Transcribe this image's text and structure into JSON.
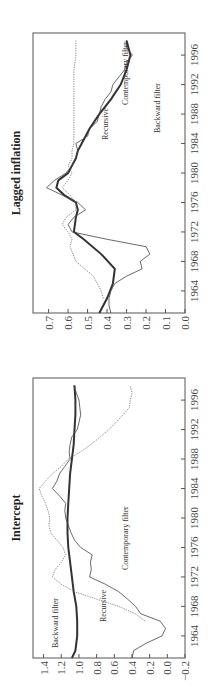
{
  "chart_data": [
    {
      "type": "line",
      "title": "Lagged inflation",
      "xlabel": "",
      "ylabel": "",
      "orientation": "rotated 90 degrees counter-clockwise",
      "x_ticks": [
        "1964",
        "1968",
        "1972",
        "1976",
        "1980",
        "1984",
        "1988",
        "1992",
        "1996"
      ],
      "y_ticks": [
        "0.0",
        "0.1",
        "0.2",
        "0.3",
        "0.4",
        "0.5",
        "0.6",
        "0.7"
      ],
      "xlim": [
        1961,
        1999
      ],
      "ylim": [
        0.0,
        0.78
      ],
      "grid": false,
      "legend": "inline labels",
      "series": [
        {
          "name": "Backward filter",
          "style": "thick solid",
          "x": [
            1961,
            1963,
            1965,
            1967,
            1969,
            1971,
            1972,
            1974,
            1975,
            1976,
            1977,
            1978,
            1979,
            1980,
            1981,
            1982,
            1983,
            1984,
            1986,
            1988,
            1990,
            1992,
            1994,
            1996,
            1998
          ],
          "y": [
            0.44,
            0.4,
            0.37,
            0.36,
            0.43,
            0.52,
            0.57,
            0.56,
            0.55,
            0.56,
            0.62,
            0.66,
            0.65,
            0.6,
            0.58,
            0.56,
            0.55,
            0.53,
            0.49,
            0.44,
            0.38,
            0.33,
            0.3,
            0.28,
            0.3
          ]
        },
        {
          "name": "Contemporary filter",
          "style": "thin solid",
          "x": [
            1961,
            1962,
            1963,
            1964,
            1965,
            1966,
            1967,
            1968,
            1969,
            1970,
            1971,
            1972,
            1973,
            1974,
            1975,
            1976,
            1977,
            1978,
            1979,
            1980,
            1981,
            1982,
            1983,
            1984,
            1985,
            1986,
            1987,
            1988,
            1989,
            1990,
            1991,
            1992,
            1993,
            1994,
            1995,
            1996,
            1997,
            1998
          ],
          "y": [
            0.38,
            0.39,
            0.39,
            0.38,
            0.36,
            0.3,
            0.22,
            0.23,
            0.18,
            0.2,
            0.4,
            0.58,
            0.6,
            0.57,
            0.51,
            0.55,
            0.63,
            0.71,
            0.67,
            0.61,
            0.58,
            0.56,
            0.55,
            0.56,
            0.5,
            0.49,
            0.45,
            0.44,
            0.43,
            0.41,
            0.38,
            0.37,
            0.34,
            0.31,
            0.3,
            0.27,
            0.3,
            0.3
          ]
        },
        {
          "name": "Recursive",
          "style": "dotted",
          "x": [
            1963,
            1964,
            1966,
            1968,
            1970,
            1971,
            1972,
            1973,
            1974,
            1975,
            1976,
            1977,
            1978,
            1979,
            1980,
            1981,
            1982,
            1983,
            1984,
            1986,
            1988,
            1990,
            1992,
            1994,
            1996,
            1998
          ],
          "y": [
            0.42,
            0.43,
            0.47,
            0.56,
            0.59,
            0.58,
            0.6,
            0.63,
            0.61,
            0.56,
            0.56,
            0.59,
            0.63,
            0.6,
            0.58,
            0.6,
            0.58,
            0.58,
            0.57,
            0.57,
            0.57,
            0.57,
            0.57,
            0.57,
            0.56,
            0.56
          ]
        }
      ]
    },
    {
      "type": "line",
      "title": "Intercept",
      "xlabel": "",
      "ylabel": "",
      "orientation": "rotated 90 degrees counter-clockwise",
      "x_ticks": [
        "1964",
        "1968",
        "1972",
        "1976",
        "1980",
        "1984",
        "1988",
        "1992",
        "1996"
      ],
      "y_ticks": [
        "−0.2",
        "0.0",
        "0.2",
        "0.4",
        "0.6",
        "0.8",
        "1.0",
        "1.2",
        "1.4"
      ],
      "xlim": [
        1961,
        1999
      ],
      "ylim": [
        -0.2,
        1.52
      ],
      "grid": false,
      "legend": "inline labels",
      "series": [
        {
          "name": "Backward filter",
          "style": "thick solid",
          "x": [
            1961,
            1962,
            1964,
            1966,
            1968,
            1970,
            1972,
            1974,
            1976,
            1978,
            1980,
            1982,
            1984,
            1986,
            1988,
            1990,
            1992,
            1994,
            1996,
            1998
          ],
          "y": [
            1.08,
            1.04,
            1.02,
            1.02,
            1.03,
            1.06,
            1.08,
            1.1,
            1.12,
            1.13,
            1.13,
            1.12,
            1.11,
            1.1,
            1.08,
            1.06,
            1.05,
            1.04,
            1.04,
            1.05
          ]
        },
        {
          "name": "Contemporary filter",
          "style": "thin solid",
          "x": [
            1961,
            1962,
            1963,
            1964,
            1965,
            1966,
            1967,
            1968,
            1969,
            1970,
            1971,
            1972,
            1973,
            1974,
            1975,
            1976,
            1977,
            1978,
            1979,
            1980,
            1981,
            1982,
            1983,
            1984,
            1985,
            1986,
            1987,
            1988,
            1989,
            1990,
            1991,
            1992,
            1993,
            1994,
            1995,
            1996,
            1997,
            1998
          ],
          "y": [
            0.4,
            0.38,
            0.24,
            0.06,
            0.02,
            0.08,
            0.3,
            0.36,
            0.45,
            0.55,
            0.7,
            0.88,
            0.86,
            0.87,
            0.85,
            0.98,
            1.05,
            1.09,
            1.12,
            1.15,
            1.16,
            1.15,
            1.22,
            1.3,
            1.25,
            1.22,
            1.16,
            1.1,
            1.11,
            1.1,
            1.08,
            1.02,
            1.0,
            0.98,
            0.99,
            1.0,
            1.03,
            1.06
          ]
        },
        {
          "name": "Recursive",
          "style": "dotted",
          "x": [
            1966,
            1967,
            1968,
            1969,
            1970,
            1971,
            1972,
            1973,
            1974,
            1975,
            1976,
            1977,
            1978,
            1979,
            1980,
            1981,
            1982,
            1983,
            1984,
            1985,
            1986,
            1987,
            1988,
            1989,
            1990,
            1991,
            1992,
            1993,
            1994,
            1995,
            1996,
            1997,
            1998
          ],
          "y": [
            0.25,
            0.36,
            0.55,
            0.8,
            1.05,
            1.2,
            1.3,
            1.27,
            1.2,
            1.15,
            1.18,
            1.25,
            1.32,
            1.34,
            1.33,
            1.35,
            1.38,
            1.42,
            1.45,
            1.38,
            1.3,
            1.2,
            1.12,
            0.98,
            0.86,
            0.76,
            0.66,
            0.58,
            0.5,
            0.43,
            0.42,
            0.4,
            0.42
          ]
        }
      ]
    }
  ],
  "panels": {
    "top": {
      "title": "Lagged inflation",
      "labels": {
        "backward": "Backward filter",
        "contemporary": "Contemporary filter",
        "recursive": "Recursive"
      }
    },
    "bottom": {
      "title": "Intercept",
      "labels": {
        "backward": "Backward filter",
        "contemporary": "Contemporary filter",
        "recursive": "Recursive"
      }
    }
  }
}
